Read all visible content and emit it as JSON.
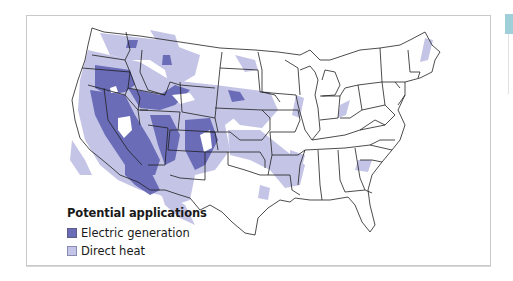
{
  "map": {
    "title": "Potential applications",
    "region": "Contiguous United States",
    "colors": {
      "electric_generation": "#6a6cb8",
      "direct_heat": "#c4c4e6",
      "state_border": "#1f1f1f",
      "frame_border": "#c9c9c9",
      "tab": "#9fcfd8"
    }
  },
  "legend": {
    "title": "Potential applications",
    "items": [
      {
        "label": "Electric generation",
        "color": "#6a6cb8"
      },
      {
        "label": "Direct heat",
        "color": "#c4c4e6"
      }
    ]
  }
}
